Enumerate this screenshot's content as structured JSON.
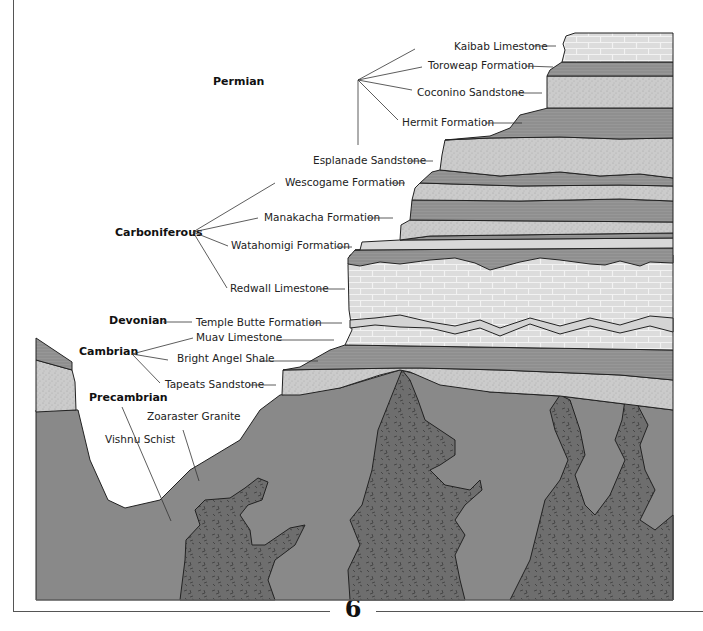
{
  "page": {
    "number": "6"
  },
  "colors": {
    "limestone": "#dcdcdc",
    "sandstone": "#c9c9c9",
    "shale": "#8e8e8e",
    "schist": "#8a8a8a",
    "granite": "#6f6f6f",
    "frame": "#555555"
  },
  "eras": {
    "permian": "Permian",
    "carboniferous": "Carboniferous",
    "devonian": "Devonian",
    "cambrian": "Cambrian",
    "precambrian": "Precambrian"
  },
  "formations": {
    "kaibab": "Kaibab Limestone",
    "toroweap": "Toroweap Formation",
    "coconino": "Coconino Sandstone",
    "hermit": "Hermit Formation",
    "esplanade": "Esplanade Sandstone",
    "wescogame": "Wescogame Formation",
    "manakacha": "Manakacha Formation",
    "watahomigi": "Watahomigi Formation",
    "redwall": "Redwall Limestone",
    "temple_butte": "Temple Butte Formation",
    "muav": "Muav Limestone",
    "bright_angel": "Bright Angel Shale",
    "tapeats": "Tapeats Sandstone",
    "zoaraster": "Zoaraster Granite",
    "vishnu": "Vishnu Schist"
  }
}
